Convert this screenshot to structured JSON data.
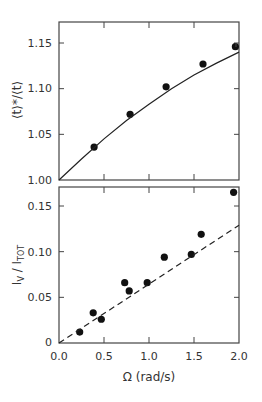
{
  "chart_data": [
    {
      "type": "scatter",
      "panel": "top",
      "title": "",
      "xlabel": "",
      "ylabel": "⟨t⟩*/⟨t⟩",
      "xlim": [
        0,
        2.0
      ],
      "ylim": [
        1.0,
        1.17
      ],
      "x_ticks": [
        0.0,
        0.5,
        1.0,
        1.5,
        2.0
      ],
      "y_ticks": [
        "1.00",
        "1.05",
        "1.10",
        "1.15"
      ],
      "grid": false,
      "series": [
        {
          "name": "data",
          "marker": "filled-circle",
          "x": [
            0.39,
            0.79,
            1.19,
            1.6,
            1.96
          ],
          "y": [
            1.036,
            1.072,
            1.102,
            1.127,
            1.146
          ]
        },
        {
          "name": "fit",
          "style": "solid-line",
          "x": [
            0.0,
            0.25,
            0.5,
            0.75,
            1.0,
            1.25,
            1.5,
            1.75,
            2.0
          ],
          "y": [
            1.0,
            1.023,
            1.045,
            1.065,
            1.083,
            1.1,
            1.115,
            1.128,
            1.14
          ]
        }
      ]
    },
    {
      "type": "scatter",
      "panel": "bottom",
      "title": "",
      "xlabel": "Ω (rad/s)",
      "ylabel": "I_V / I_TOT",
      "xlim": [
        0,
        2.0
      ],
      "ylim": [
        0,
        0.17
      ],
      "x_ticks": [
        "0.0",
        "0.5",
        "1.0",
        "1.5",
        "2.0"
      ],
      "y_ticks": [
        "0",
        "0.05",
        "0.10",
        "0.15"
      ],
      "grid": false,
      "series": [
        {
          "name": "data",
          "marker": "filled-circle",
          "x": [
            0.23,
            0.38,
            0.47,
            0.73,
            0.78,
            0.98,
            1.17,
            1.47,
            1.58,
            1.94
          ],
          "y": [
            0.012,
            0.033,
            0.026,
            0.066,
            0.057,
            0.066,
            0.094,
            0.097,
            0.119,
            0.165
          ]
        },
        {
          "name": "linear",
          "style": "dashed-line",
          "x": [
            0.0,
            2.0
          ],
          "y": [
            0.0,
            0.129
          ]
        }
      ]
    }
  ],
  "labels": {
    "top_ylabel_main": "⟨t⟩*/⟨t⟩",
    "bottom_ylabel_I1": "I",
    "bottom_ylabel_sub1": "V",
    "bottom_ylabel_slash": " / I",
    "bottom_ylabel_sub2": "TOT",
    "xlabel": "Ω (rad/s)",
    "top_yticks": [
      "1.00",
      "1.05",
      "1.10",
      "1.15"
    ],
    "bottom_yticks": [
      "0",
      "0.05",
      "0.10",
      "0.15"
    ],
    "xticks": [
      "0.0",
      "0.5",
      "1.0",
      "1.5",
      "2.0"
    ]
  }
}
